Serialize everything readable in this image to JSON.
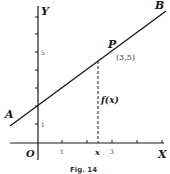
{
  "figure": {
    "caption": "Fig. 14",
    "axes": {
      "x_label": "X",
      "y_label": "Y",
      "origin_label": "O",
      "x_ticks": [
        "1",
        "3"
      ],
      "y_ticks": [
        "1",
        "5"
      ],
      "x_var_label": "x"
    },
    "line": {
      "start_label": "A",
      "end_label": "B"
    },
    "point": {
      "label": "P",
      "coords": "(3,5)"
    },
    "ordinate_label": "f(x)"
  },
  "colors": {
    "ink": "#1a1a1a",
    "background": "#ffffff"
  }
}
